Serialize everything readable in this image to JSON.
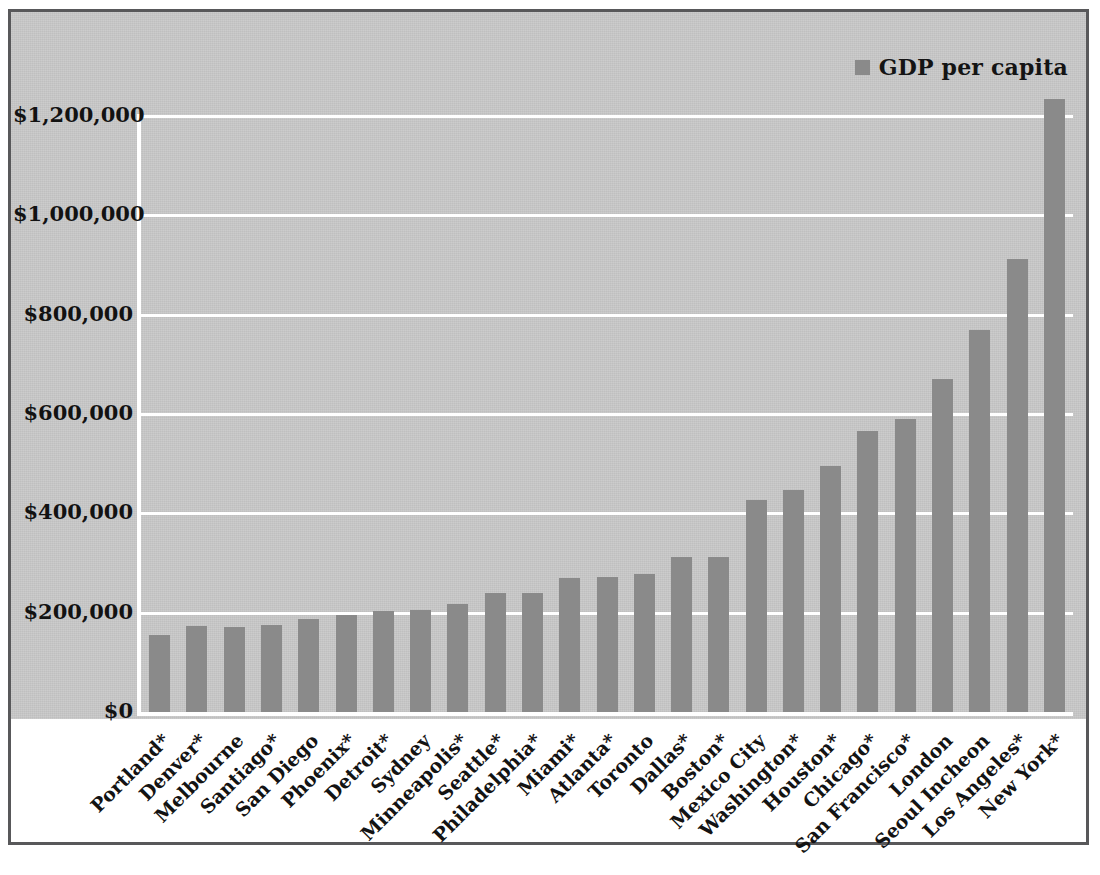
{
  "chart_data": {
    "type": "bar",
    "title": "",
    "subtitle": "",
    "xlabel": "",
    "ylabel": "",
    "ylim": [
      0,
      1200000
    ],
    "grid": true,
    "legend_position": "top-right",
    "y_tick_labels": [
      "$1,200,000",
      "$1,000,000",
      "$800,000",
      "$600,000",
      "$400,000",
      "$200,000",
      "$0"
    ],
    "y_ticks": [
      1200000,
      1000000,
      800000,
      600000,
      400000,
      200000,
      0
    ],
    "series": [
      {
        "name": "GDP per capita",
        "color": "#8a8a8a",
        "values": [
          155000,
          173000,
          171000,
          176000,
          187000,
          195000,
          203000,
          205000,
          218000,
          240000,
          240000,
          269000,
          272000,
          278000,
          313000,
          313000,
          427000,
          448000,
          496000,
          565000,
          589000,
          671000,
          769000,
          913000,
          1234000
        ]
      }
    ],
    "categories": [
      "Portland*",
      "Denver*",
      "Melbourne",
      "Santiago*",
      "San Diego",
      "Phoenix*",
      "Detroit*",
      "Sydney",
      "Minneapolis*",
      "Seattle*",
      "Philadelphia*",
      "Miami*",
      "Atlanta*",
      "Toronto",
      "Dallas*",
      "Boston*",
      "Mexico City",
      "Washington*",
      "Houston*",
      "Chicago*",
      "San Francisco*",
      "London",
      "Seoul Incheon",
      "Los Angeles*",
      "New York*"
    ]
  },
  "legend": {
    "entries": [
      {
        "label": "GDP per capita",
        "color": "#8a8a8a"
      }
    ]
  },
  "colors": {
    "bar": "#8a8a8a",
    "plot_background": "#c9c9c9",
    "gridline": "#ffffff",
    "frame_border": "#58585a",
    "text": "#121212"
  }
}
